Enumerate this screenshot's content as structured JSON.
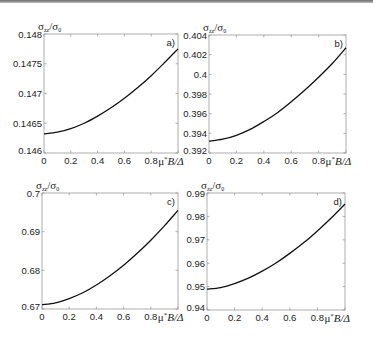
{
  "chart_data": [
    {
      "type": "line",
      "panel": "a)",
      "ylabel": "σzz/σ0",
      "xlabel": "μ*B/Δ",
      "x": [
        0,
        0.1,
        0.2,
        0.3,
        0.4,
        0.5,
        0.6,
        0.7,
        0.8,
        0.9,
        1.0
      ],
      "values": [
        0.14632,
        0.14635,
        0.14641,
        0.1465,
        0.14662,
        0.14676,
        0.14692,
        0.1471,
        0.1473,
        0.14752,
        0.14775
      ],
      "xlim": [
        0,
        1
      ],
      "ylim": [
        0.146,
        0.148
      ],
      "xticks": [
        "0",
        "0.2",
        "0.4",
        "0.6",
        "0.8"
      ],
      "yticks": [
        "0.146",
        "0.1465",
        "0.147",
        "0.1475",
        "0.148"
      ],
      "ytick_values": [
        0.146,
        0.1465,
        0.147,
        0.1475,
        0.148
      ],
      "grid": false,
      "box": [
        44,
        34,
        178,
        153
      ]
    },
    {
      "type": "line",
      "panel": "b)",
      "ylabel": "σzz/σ0",
      "xlabel": "μ*B/Δ",
      "x": [
        0,
        0.1,
        0.2,
        0.3,
        0.4,
        0.5,
        0.6,
        0.7,
        0.8,
        0.9,
        1.0
      ],
      "values": [
        0.3932,
        0.3934,
        0.3938,
        0.3944,
        0.3952,
        0.3961,
        0.3972,
        0.3984,
        0.3997,
        0.4011,
        0.4027
      ],
      "xlim": [
        0,
        1
      ],
      "ylim": [
        0.392,
        0.404
      ],
      "xticks": [
        "0",
        "0.2",
        "0.4",
        "0.6",
        "0.8"
      ],
      "yticks": [
        "0.392",
        "0.394",
        "0.396",
        "0.398",
        "0.4",
        "0.402",
        "0.404"
      ],
      "ytick_values": [
        0.392,
        0.394,
        0.396,
        0.398,
        0.4,
        0.402,
        0.404
      ],
      "grid": false,
      "box": [
        209,
        35,
        346,
        153
      ]
    },
    {
      "type": "line",
      "panel": "c)",
      "ylabel": "σzz/σ0",
      "xlabel": "μ*B/Δ",
      "x": [
        0,
        0.1,
        0.2,
        0.3,
        0.4,
        0.5,
        0.6,
        0.7,
        0.8,
        0.9,
        1.0
      ],
      "values": [
        0.6711,
        0.6716,
        0.6727,
        0.6742,
        0.6762,
        0.6786,
        0.6813,
        0.6844,
        0.6878,
        0.6915,
        0.6955
      ],
      "xlim": [
        0,
        1
      ],
      "ylim": [
        0.67,
        0.7
      ],
      "xticks": [
        "0",
        "0.2",
        "0.4",
        "0.6",
        "0.8"
      ],
      "yticks": [
        "0.67",
        "0.68",
        "0.69",
        "0.7"
      ],
      "ytick_values": [
        0.67,
        0.68,
        0.69,
        0.7
      ],
      "grid": false,
      "box": [
        42,
        193,
        178,
        309
      ]
    },
    {
      "type": "line",
      "panel": "d)",
      "ylabel": "σzz/σ0",
      "xlabel": "μ*B/Δ",
      "x": [
        0,
        0.1,
        0.2,
        0.3,
        0.4,
        0.5,
        0.6,
        0.7,
        0.8,
        0.9,
        1.0
      ],
      "values": [
        0.9489,
        0.9496,
        0.9513,
        0.9536,
        0.9566,
        0.9601,
        0.9642,
        0.9687,
        0.9738,
        0.9793,
        0.9853
      ],
      "xlim": [
        0,
        1
      ],
      "ylim": [
        0.94,
        0.99
      ],
      "xticks": [
        "0",
        "0.2",
        "0.4",
        "0.6",
        "0.8"
      ],
      "yticks": [
        "0.94",
        "0.95",
        "0.96",
        "0.97",
        "0.98",
        "0.99"
      ],
      "ytick_values": [
        0.94,
        0.95,
        0.96,
        0.97,
        0.98,
        0.99
      ],
      "grid": false,
      "box": [
        207,
        193,
        345,
        310
      ]
    }
  ],
  "labels": {
    "sigma": "σ",
    "ylabel_sub": "zz",
    "ylabel_den_sub": "0",
    "xlabel_mu": "μ",
    "xlabel_star": "*",
    "xlabel_rest": "B/Δ"
  }
}
